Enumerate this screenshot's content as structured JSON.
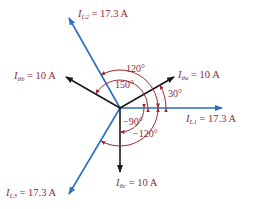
{
  "diagram": {
    "type": "phasor-diagram",
    "colors": {
      "line_current": "#2e6dbf",
      "phase_current": "#1a1a1a",
      "angle_arc": "#9b2c33",
      "label_text": "#8b2a35"
    },
    "line_currents": [
      {
        "symbol": "I",
        "subscript": "L1",
        "value": "= 17.3 A",
        "angle_deg": 0
      },
      {
        "symbol": "I",
        "subscript": "L2",
        "value": "= 17.3 A",
        "angle_deg": 120
      },
      {
        "symbol": "I",
        "subscript": "L3",
        "value": "= 17.3 A",
        "angle_deg": -120
      }
    ],
    "phase_currents": [
      {
        "symbol": "I",
        "subscript": "θa",
        "value": "= 10 A",
        "angle_deg": 30
      },
      {
        "symbol": "I",
        "subscript": "θb",
        "value": "= 10 A",
        "angle_deg": 150
      },
      {
        "symbol": "I",
        "subscript": "θc",
        "value": "= 10 A",
        "angle_deg": -90
      }
    ],
    "angle_labels": {
      "a30": "30°",
      "a120": "120°",
      "a150": "150°",
      "a_neg90": "−90°",
      "a_neg120": "−120°"
    }
  }
}
